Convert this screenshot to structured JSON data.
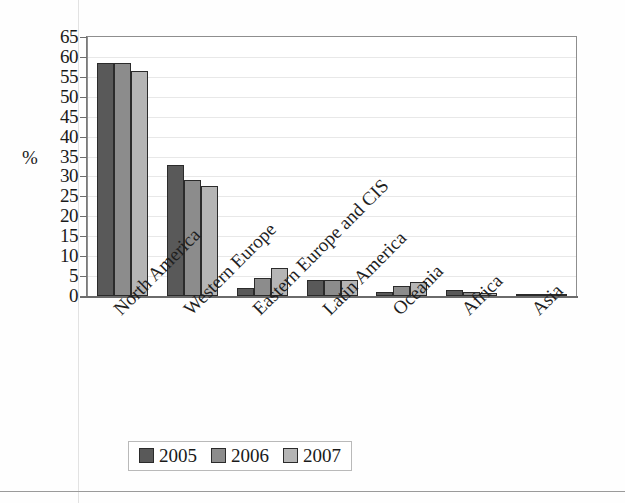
{
  "chart_data": {
    "type": "bar",
    "title": "",
    "subtitle": "",
    "xlabel": "",
    "ylabel": "%",
    "ylim": [
      0,
      65
    ],
    "ytick_step": 5,
    "yticks": [
      65,
      60,
      55,
      50,
      45,
      40,
      35,
      30,
      25,
      20,
      15,
      10,
      5,
      0
    ],
    "grid": true,
    "grid_axis": "y",
    "legend_position": "bottom",
    "categories": [
      "North America",
      "Western Europe",
      "Eastern Europe and CIS",
      "Latin America",
      "Oceania",
      "Africa",
      "Asia"
    ],
    "series": [
      {
        "name": "2005",
        "color": "#595959",
        "values": [
          58.5,
          33.0,
          2.0,
          4.0,
          1.0,
          1.5,
          0.4
        ]
      },
      {
        "name": "2006",
        "color": "#8c8c8c",
        "values": [
          58.5,
          29.0,
          4.5,
          4.0,
          2.5,
          1.0,
          0.4
        ]
      },
      {
        "name": "2007",
        "color": "#b5b5b5",
        "values": [
          56.5,
          27.5,
          7.0,
          4.0,
          3.5,
          0.8,
          0.5
        ]
      }
    ]
  },
  "legend": {
    "items": [
      {
        "label": "2005",
        "color": "#595959"
      },
      {
        "label": "2006",
        "color": "#8c8c8c"
      },
      {
        "label": "2007",
        "color": "#b5b5b5"
      }
    ]
  },
  "axes": {
    "y_title": "%"
  }
}
